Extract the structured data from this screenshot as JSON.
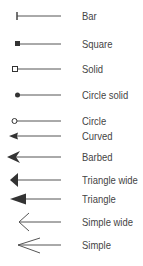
{
  "colors": {
    "line": "#555555",
    "text": "#444444",
    "background": "#ffffff"
  },
  "items": [
    {
      "label": "Bar",
      "icon": "bar-end-icon"
    },
    {
      "label": "Square",
      "icon": "square-end-icon"
    },
    {
      "label": "Solid",
      "icon": "hollow-square-end-icon"
    },
    {
      "label": "Circle solid",
      "icon": "filled-circle-end-icon"
    },
    {
      "label": "Circle",
      "icon": "hollow-circle-end-icon"
    },
    {
      "label": "Curved",
      "icon": "curved-arrow-end-icon"
    },
    {
      "label": "Barbed",
      "icon": "barbed-arrow-end-icon"
    },
    {
      "label": "Triangle wide",
      "icon": "wide-triangle-arrow-end-icon"
    },
    {
      "label": "Triangle",
      "icon": "triangle-arrow-end-icon"
    },
    {
      "label": "Simple wide",
      "icon": "wide-simple-arrow-end-icon"
    },
    {
      "label": "Simple",
      "icon": "simple-arrow-end-icon"
    }
  ]
}
